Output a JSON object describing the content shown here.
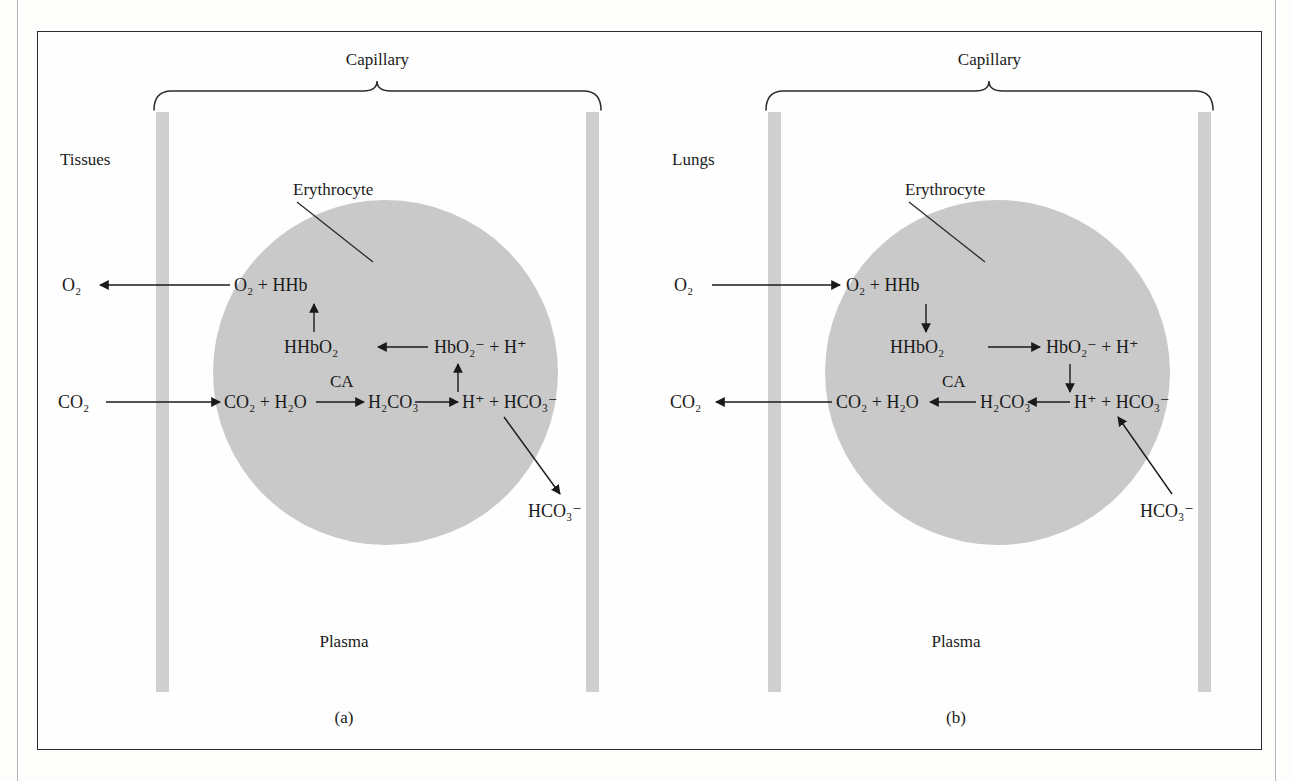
{
  "figure": {
    "panels": [
      {
        "id": "a",
        "caption": "(a)",
        "region_label": "Tissues",
        "capillary_label": "Capillary",
        "erythrocyte_label": "Erythrocyte",
        "plasma_label": "Plasma",
        "external_gases": [
          {
            "name": "oxygen-out",
            "label": "O₂",
            "direction": "left",
            "note": "O2 leaves capillary into tissues"
          },
          {
            "name": "carbon-dioxide-in",
            "label": "CO₂",
            "direction": "right",
            "note": "CO2 enters capillary from tissues"
          }
        ],
        "reactions": {
          "row_top": "O₂ + HHb",
          "row_middle_left": "HHbO₂",
          "row_middle_right": "HbO₂⁻ + H⁺",
          "row_bottom_left": "CO₂ + H₂O",
          "row_bottom_middle": "H₂CO₃",
          "row_bottom_right": "H⁺ + HCO₃⁻",
          "catalyst": "CA",
          "bicarbonate_plasma": "HCO₃⁻"
        },
        "arrow_directions": {
          "middle_row": "left",
          "bottom_first": "right",
          "bottom_second": "right",
          "vertical_left": "up",
          "vertical_right": "up",
          "diagonal_bicarbonate": "out"
        }
      },
      {
        "id": "b",
        "caption": "(b)",
        "region_label": "Lungs",
        "capillary_label": "Capillary",
        "erythrocyte_label": "Erythrocyte",
        "plasma_label": "Plasma",
        "external_gases": [
          {
            "name": "oxygen-in",
            "label": "O₂",
            "direction": "right",
            "note": "O2 enters capillary from lungs"
          },
          {
            "name": "carbon-dioxide-out",
            "label": "CO₂",
            "direction": "left",
            "note": "CO2 leaves capillary into lungs"
          }
        ],
        "reactions": {
          "row_top": "O₂ + HHb",
          "row_middle_left": "HHbO₂",
          "row_middle_right": "HbO₂⁻ + H⁺",
          "row_bottom_left": "CO₂ + H₂O",
          "row_bottom_middle": "H₂CO₃",
          "row_bottom_right": "H⁺ + HCO₃⁻",
          "catalyst": "CA",
          "bicarbonate_plasma": "HCO₃⁻"
        },
        "arrow_directions": {
          "middle_row": "right",
          "bottom_first": "left",
          "bottom_second": "left",
          "vertical_left": "down",
          "vertical_right": "down",
          "diagonal_bicarbonate": "in"
        }
      }
    ]
  },
  "colors": {
    "erythrocyte_fill": "#c9c9c9",
    "capillary_wall": "#cfcfcf",
    "frame_border": "#2b2b2b",
    "ink": "#1a1a1a",
    "page_background": "#fdfdfc"
  }
}
